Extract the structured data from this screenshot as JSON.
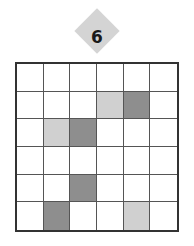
{
  "puzzle": {
    "number": "6",
    "rows": 6,
    "cols": 6,
    "colors": {
      "empty": "#ffffff",
      "light": "#d0d0d0",
      "dark": "#8e8e8e"
    },
    "cells": [
      [
        "empty",
        "empty",
        "empty",
        "empty",
        "empty",
        "empty"
      ],
      [
        "empty",
        "empty",
        "empty",
        "light",
        "dark",
        "empty"
      ],
      [
        "empty",
        "light",
        "dark",
        "empty",
        "empty",
        "empty"
      ],
      [
        "empty",
        "empty",
        "empty",
        "empty",
        "empty",
        "empty"
      ],
      [
        "empty",
        "empty",
        "dark",
        "empty",
        "empty",
        "empty"
      ],
      [
        "empty",
        "dark",
        "empty",
        "empty",
        "light",
        "empty"
      ]
    ]
  }
}
